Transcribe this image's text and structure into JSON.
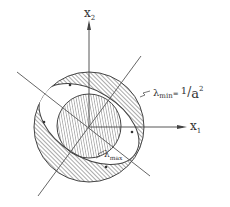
{
  "figure": {
    "axes": {
      "x_axis_label": "x",
      "x_axis_sub": "1",
      "y_axis_label": "x",
      "y_axis_sub": "2"
    },
    "annotations": {
      "outer_label_lambda": "λ",
      "outer_label_sub": "min",
      "outer_label_eq": "= ",
      "outer_label_num": "1",
      "outer_label_slash": "/",
      "outer_label_den": "a",
      "outer_label_exp": "2",
      "inner_label_lambda": "λ",
      "inner_label_sub": "max"
    },
    "colors": {
      "ink": "#444444",
      "background": "#ffffff"
    }
  }
}
